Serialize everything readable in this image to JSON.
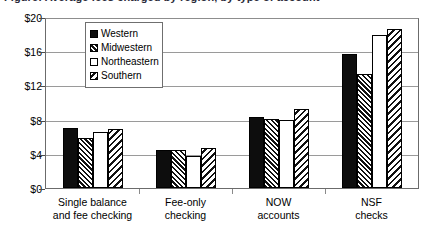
{
  "title_sliver": "Figure: Average fees charged by region, by type of account",
  "chart_data": {
    "type": "bar",
    "title": "",
    "xlabel": "",
    "ylabel": "",
    "ylim": [
      0,
      20
    ],
    "yticks": [
      "$0",
      "$4",
      "$8",
      "$12",
      "$16",
      "$20"
    ],
    "ytick_values": [
      0,
      4,
      8,
      12,
      16,
      20
    ],
    "grid": true,
    "legend_position": "upper-left-inside",
    "categories": [
      "Single balance and fee checking",
      "Fee-only checking",
      "NOW accounts",
      "NSF checks"
    ],
    "category_lines": [
      [
        "Single balance",
        "and fee checking"
      ],
      [
        "Fee-only",
        "checking"
      ],
      [
        "NOW",
        "accounts"
      ],
      [
        "NSF",
        "checks"
      ]
    ],
    "series": [
      {
        "name": "Western",
        "pattern": "solid-black",
        "values": [
          7.0,
          4.4,
          8.3,
          15.7
        ]
      },
      {
        "name": "Midwestern",
        "pattern": "dense-diagonal",
        "values": [
          5.8,
          4.4,
          8.1,
          13.3
        ]
      },
      {
        "name": "Northeastern",
        "pattern": "white-empty",
        "values": [
          6.5,
          3.8,
          8.0,
          17.9
        ]
      },
      {
        "name": "Southern",
        "pattern": "sparse-diagonal",
        "values": [
          6.9,
          4.7,
          9.2,
          18.6
        ]
      }
    ]
  },
  "legend": {
    "items": [
      {
        "label": "Western"
      },
      {
        "label": "Midwestern"
      },
      {
        "label": "Northeastern"
      },
      {
        "label": "Southern"
      }
    ]
  },
  "colors": {
    "series_western": "#0d0d0d",
    "grid": "#9a9a9a",
    "axis": "#6b6b6b",
    "background": "#ffffff"
  }
}
